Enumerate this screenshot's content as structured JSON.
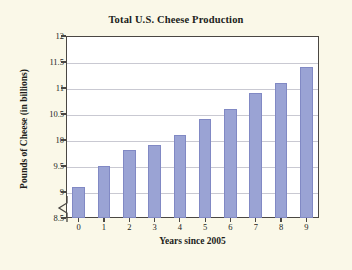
{
  "chart_data": {
    "type": "bar",
    "title": "Total U.S. Cheese Production",
    "xlabel": "Years since 2005",
    "ylabel": "Pounds of Cheese (in billions)",
    "categories": [
      "0",
      "1",
      "2",
      "3",
      "4",
      "5",
      "6",
      "7",
      "8",
      "9"
    ],
    "values": [
      9.1,
      9.5,
      9.8,
      9.9,
      10.1,
      10.4,
      10.6,
      10.9,
      11.1,
      11.4
    ],
    "ylim": [
      8.5,
      12
    ],
    "yticks": [
      "8.5",
      "9",
      "9.5",
      "10",
      "10.5",
      "11",
      "11.5",
      "12"
    ],
    "ytick_values": [
      8.5,
      9,
      9.5,
      10,
      10.5,
      11,
      11.5,
      12
    ],
    "grid": true,
    "legend": "none",
    "axis_break": true,
    "bar_color": "#9aa3d4",
    "bar_edge_color": "#8189c4",
    "grid_color": "#c9c9d2",
    "frame_color": "#4a4743",
    "plot_background": "#ffffff",
    "figure_background": "#faf8e8",
    "text_color": "#211d1a"
  }
}
